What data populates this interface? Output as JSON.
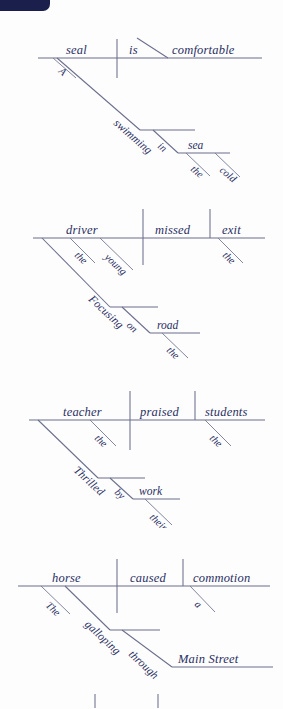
{
  "page": {
    "background_color": "#fdfdfd",
    "line_color": "#6b6f8c",
    "text_color": "#2a2f63",
    "badge_color": "#1b1f4b"
  },
  "diagrams": [
    {
      "id": "diagram-seal",
      "sentence": "A seal swimming in the cold sea is comfortable.",
      "subject": "seal",
      "verb": "is",
      "predicate_adjective": "comfortable",
      "subject_modifier": "A",
      "participle": "swimming",
      "preposition": "in",
      "prep_object": "sea",
      "prep_object_modifiers": [
        "the",
        "cold"
      ]
    },
    {
      "id": "diagram-driver",
      "sentence": "The young driver focusing on the road missed the exit.",
      "subject": "driver",
      "verb": "missed",
      "direct_object": "exit",
      "subject_modifiers": [
        "the",
        "young"
      ],
      "object_modifier": "the",
      "participle": "Focusing",
      "preposition": "on",
      "prep_object": "road",
      "prep_object_modifier": "the"
    },
    {
      "id": "diagram-teacher",
      "sentence": "Thrilled by their work, the teacher praised the students.",
      "subject": "teacher",
      "verb": "praised",
      "direct_object": "students",
      "subject_modifier": "the",
      "object_modifier": "the",
      "participle": "Thrilled",
      "preposition": "by",
      "prep_object": "work",
      "prep_object_modifier": "their"
    },
    {
      "id": "diagram-horse",
      "sentence": "The horse galloping through Main Street caused a commotion.",
      "subject": "horse",
      "verb": "caused",
      "direct_object": "commotion",
      "subject_modifier": "The",
      "object_modifier": "a",
      "participle": "galloping",
      "preposition": "through",
      "prep_object": "Main Street"
    }
  ]
}
